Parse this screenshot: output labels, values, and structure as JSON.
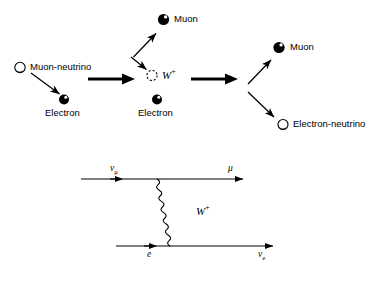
{
  "figure": {
    "title_hidden": "",
    "background_color": "#ffffff",
    "ink_color": "#000000"
  },
  "upper_diagram": {
    "name": "particle-interaction-pictorial",
    "particles": {
      "muon_neutrino_in": {
        "label": "Muon-neutrino",
        "glyph": "hollow-circle",
        "x": 20,
        "y": 62
      },
      "electron_in": {
        "label": "Electron",
        "glyph": "filled-circle",
        "x": 63,
        "y": 95
      },
      "w_boson": {
        "label": "W",
        "superscript": "+",
        "glyph": "dashed-circle",
        "x": 151,
        "y": 74
      },
      "electron_mid": {
        "label": "Electron",
        "glyph": "filled-circle",
        "x": 156,
        "y": 100
      },
      "muon_top": {
        "label": "Muon",
        "glyph": "filled-circle",
        "x": 161,
        "y": 16
      },
      "muon_out": {
        "label": "Muon",
        "glyph": "filled-circle",
        "x": 277,
        "y": 43
      },
      "electron_neutrino_out": {
        "label": "Electron-neutrino",
        "glyph": "hollow-circle",
        "x": 281,
        "y": 119
      }
    },
    "arrows": {
      "thick_left": "bold-right-arrow",
      "thick_right": "bold-right-arrow",
      "thin_neutrino_to_electron": "thin-diagonal-arrow-down-right",
      "thin_to_w": "thin-diagonal-arrow-down-right",
      "thin_to_muon_top": "thin-diagonal-arrow-up-right",
      "thin_to_muon_out": "thin-diagonal-arrow-up-right",
      "thin_to_electron_neutrino": "thin-diagonal-arrow-down-right"
    }
  },
  "feynman_diagram": {
    "name": "feynman-diagram-inverse-muon-decay",
    "labels": {
      "top_left": "ν",
      "top_left_sub": "μ",
      "top_right": "μ",
      "bottom_left": "e",
      "bottom_right": "ν",
      "bottom_right_sub": "e",
      "propagator": "W",
      "propagator_sup": "+"
    },
    "lines": {
      "top_fermion_line": {
        "x1": 81,
        "y1": 179,
        "x2": 243,
        "y2": 179,
        "arrow_at": 118
      },
      "bottom_fermion_line": {
        "x1": 116,
        "y1": 246,
        "x2": 273,
        "y2": 246,
        "arrow_at": 152
      },
      "w_propagator": {
        "x1": 157,
        "y1": 179,
        "x2": 192,
        "y2": 246,
        "style": "wavy"
      }
    }
  }
}
